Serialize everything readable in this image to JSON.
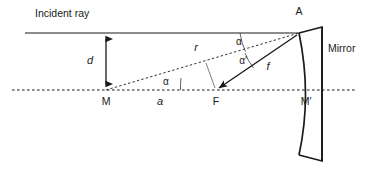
{
  "diagram": {
    "labels": {
      "incident_ray": "Incident ray",
      "mirror": "Mirror",
      "point_m": "M",
      "point_m_prime": "M′",
      "point_f": "F",
      "point_a": "A",
      "dist_d": "d",
      "dist_a": "a",
      "dist_r": "r",
      "dist_f": "f",
      "angle_alpha_m": "α",
      "angle_alpha_a": "α",
      "angle_alpha_prime": "α′"
    },
    "colors": {
      "ink": "#1a1a1a",
      "thin_ink": "#5a5a5a",
      "background": "#ffffff"
    },
    "geometry": {
      "point_m": [
        106,
        90
      ],
      "point_f": [
        215,
        90
      ],
      "point_a": [
        299,
        33
      ],
      "point_m_prime": [
        305,
        90
      ],
      "incident_ray_start": [
        25,
        33
      ],
      "axis_start": [
        12,
        90
      ],
      "axis_end": [
        355,
        90
      ],
      "mirror_right_edge_x": 322,
      "mirror_top_y": 27,
      "mirror_bottom_y": 161
    }
  }
}
